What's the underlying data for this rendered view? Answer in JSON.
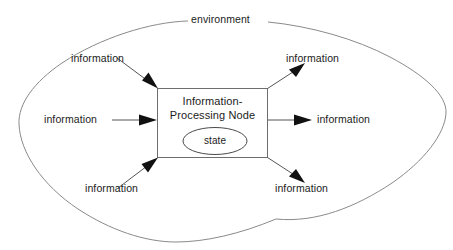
{
  "diagram": {
    "title_label": "environment",
    "node": {
      "line1": "Information-",
      "line2": "Processing Node",
      "state_label": "state"
    },
    "inputs": [
      {
        "id": "top-left",
        "label": "information"
      },
      {
        "id": "middle-left",
        "label": "information"
      },
      {
        "id": "bottom-left",
        "label": "information"
      }
    ],
    "outputs": [
      {
        "id": "top-right",
        "label": "information"
      },
      {
        "id": "middle-right",
        "label": "information"
      },
      {
        "id": "bottom-right",
        "label": "information"
      }
    ],
    "colors": {
      "background": "#ffffff",
      "environment_stroke": "#8a8a8a",
      "node_stroke": "#6e6e6e",
      "state_stroke": "#4a4a4a",
      "flow_stroke": "#55555a",
      "arrow_fill": "#111111",
      "text": "#1b1b1b"
    }
  }
}
